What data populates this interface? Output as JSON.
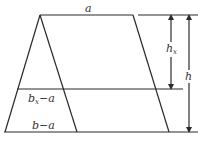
{
  "diagram": {
    "colors": {
      "line": "#2a2a2a",
      "text": "#333333",
      "background": "#ffffff"
    },
    "labels": {
      "top_width": "a",
      "mid_width_base": "b",
      "mid_width_sub": "x",
      "mid_width_suffix": "−a",
      "bottom_width": "b−a",
      "partial_height_base": "h",
      "partial_height_sub": "x",
      "total_height": "h"
    }
  }
}
